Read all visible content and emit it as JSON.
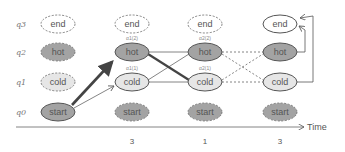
{
  "diagram": {
    "row_labels": [
      "q3",
      "q2",
      "q1",
      "q0"
    ],
    "states": [
      "end",
      "hot",
      "cold",
      "start"
    ],
    "columns": [
      {
        "index": 0,
        "nodes": {
          "end": "end",
          "hot": "hot",
          "cold": "cold",
          "start": "start"
        },
        "active": [
          "start"
        ]
      },
      {
        "index": 1,
        "nodes": {
          "end": "end",
          "hot": "hot",
          "cold": "cold",
          "start": "start"
        },
        "active": [
          "hot",
          "cold"
        ],
        "annotations": {
          "hot": "α1(2)",
          "cold": "α1(1)"
        }
      },
      {
        "index": 2,
        "nodes": {
          "end": "end",
          "hot": "hot",
          "cold": "cold",
          "start": "start"
        },
        "active": [
          "hot",
          "cold"
        ],
        "annotations": {
          "hot": "α2(2)",
          "cold": "α2(1)"
        }
      },
      {
        "index": 3,
        "nodes": {
          "end": "end",
          "hot": "hot",
          "cold": "cold",
          "start": "start"
        },
        "active": [
          "end",
          "hot",
          "cold"
        ]
      }
    ],
    "observations": [
      "3",
      "1",
      "3"
    ],
    "axis_label": "Time",
    "colors": {
      "dark_fill": "#a3a3a3",
      "light_fill": "#e6e6e6",
      "stroke": "#555555",
      "bold_edge": "#444444"
    }
  }
}
